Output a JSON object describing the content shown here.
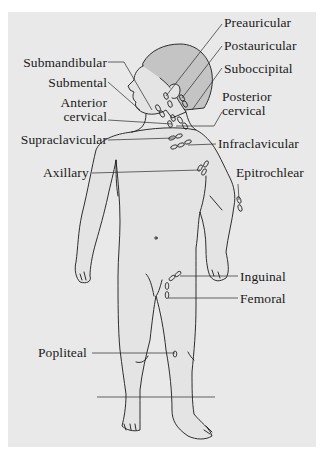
{
  "diagram": {
    "colors": {
      "background": "#e9e9e9",
      "border": "#ffffff",
      "skin": "#e4e4e4",
      "hair": "#c4c4c4",
      "outline": "#1a1a1a",
      "leader_line": "#2a2a2a"
    },
    "labels": {
      "preauricular": "Preauricular",
      "postauricular": "Postauricular",
      "suboccipital": "Suboccipital",
      "submandibular": "Submandibular",
      "submental": "Submental",
      "anterior_cervical_1": "Anterior",
      "anterior_cervical_2": "cervical",
      "posterior_cervical_1": "Posterior",
      "posterior_cervical_2": "cervical",
      "supraclavicular": "Supraclavicular",
      "infraclavicular": "Infraclavicular",
      "axillary": "Axillary",
      "epitrochlear": "Epitrochlear",
      "inguinal": "Inguinal",
      "femoral": "Femoral",
      "popliteal": "Popliteal"
    }
  }
}
